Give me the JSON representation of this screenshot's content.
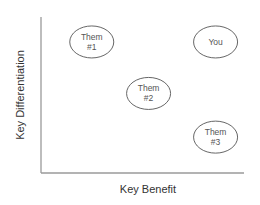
{
  "diagram": {
    "type": "positioning-map",
    "x_axis_label": "Key Benefit",
    "y_axis_label": "Key Differentiation",
    "items": [
      {
        "id": "them-1",
        "lines": [
          "Them",
          "#1"
        ],
        "benefit": 0.25,
        "differentiation": 0.84
      },
      {
        "id": "you",
        "lines": [
          "You"
        ],
        "benefit": 0.86,
        "differentiation": 0.84
      },
      {
        "id": "them-2",
        "lines": [
          "Them",
          "#2"
        ],
        "benefit": 0.53,
        "differentiation": 0.51
      },
      {
        "id": "them-3",
        "lines": [
          "Them",
          "#3"
        ],
        "benefit": 0.86,
        "differentiation": 0.23
      }
    ]
  }
}
